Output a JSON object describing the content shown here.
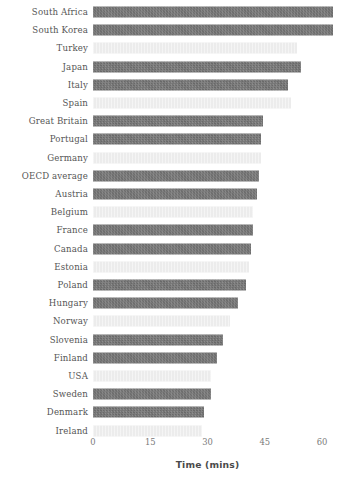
{
  "chart_data": {
    "type": "bar",
    "orientation": "horizontal",
    "title": "",
    "subtitle": "",
    "xlabel": "Time (mins)",
    "ylabel": "",
    "xlim": [
      0,
      64
    ],
    "xticks": [
      0,
      15,
      30,
      45,
      60
    ],
    "xtick_labels": [
      "0",
      "15",
      "30",
      "45",
      "60"
    ],
    "grid": false,
    "legend": "none",
    "colors": {
      "dark_bar": "#6f6f6f",
      "light_bar": "#ececec",
      "label_text": "#555555",
      "tick_text": "#7a7a7a",
      "axis_title_text": "#4a4a4a",
      "background": "#ffffff"
    },
    "categories": [
      "South Africa",
      "South Korea",
      "Turkey",
      "Japan",
      "Italy",
      "Spain",
      "Great Britain",
      "Portugal",
      "Germany",
      "OECD average",
      "Austria",
      "Belgium",
      "France",
      "Canada",
      "Estonia",
      "Poland",
      "Hungary",
      "Norway",
      "Slovenia",
      "Finland",
      "USA",
      "Sweden",
      "Denmark",
      "Ireland"
    ],
    "values": [
      63,
      63,
      53.5,
      54.5,
      51,
      52,
      44.5,
      44,
      44,
      43.5,
      43,
      42,
      42,
      41.5,
      41,
      40,
      38,
      36,
      34,
      32.5,
      31,
      31,
      29,
      28.5
    ],
    "bars": [
      {
        "label": "South Africa",
        "value": 63,
        "shade": "dark"
      },
      {
        "label": "South Korea",
        "value": 63,
        "shade": "dark"
      },
      {
        "label": "Turkey",
        "value": 53.5,
        "shade": "light"
      },
      {
        "label": "Japan",
        "value": 54.5,
        "shade": "dark"
      },
      {
        "label": "Italy",
        "value": 51,
        "shade": "dark"
      },
      {
        "label": "Spain",
        "value": 52,
        "shade": "light"
      },
      {
        "label": "Great Britain",
        "value": 44.5,
        "shade": "dark"
      },
      {
        "label": "Portugal",
        "value": 44,
        "shade": "dark"
      },
      {
        "label": "Germany",
        "value": 44,
        "shade": "light"
      },
      {
        "label": "OECD average",
        "value": 43.5,
        "shade": "dark"
      },
      {
        "label": "Austria",
        "value": 43,
        "shade": "dark"
      },
      {
        "label": "Belgium",
        "value": 42,
        "shade": "light"
      },
      {
        "label": "France",
        "value": 42,
        "shade": "dark"
      },
      {
        "label": "Canada",
        "value": 41.5,
        "shade": "dark"
      },
      {
        "label": "Estonia",
        "value": 41,
        "shade": "light"
      },
      {
        "label": "Poland",
        "value": 40,
        "shade": "dark"
      },
      {
        "label": "Hungary",
        "value": 38,
        "shade": "dark"
      },
      {
        "label": "Norway",
        "value": 36,
        "shade": "light"
      },
      {
        "label": "Slovenia",
        "value": 34,
        "shade": "dark"
      },
      {
        "label": "Finland",
        "value": 32.5,
        "shade": "dark"
      },
      {
        "label": "USA",
        "value": 31,
        "shade": "light"
      },
      {
        "label": "Sweden",
        "value": 31,
        "shade": "dark"
      },
      {
        "label": "Denmark",
        "value": 29,
        "shade": "dark"
      },
      {
        "label": "Ireland",
        "value": 28.5,
        "shade": "light"
      }
    ]
  },
  "layout": {
    "plot_left_px": 93,
    "plot_right_px": 322,
    "row_pitch_px": 18.2,
    "first_row_center_px": 12,
    "bar_height_px": 11
  }
}
